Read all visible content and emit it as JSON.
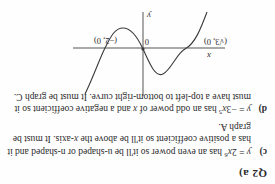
{
  "page": {
    "question_marker": "Q2 a)"
  },
  "graph": {
    "x_axis_label": "x",
    "y_axis_label": "y",
    "origin_label": "0",
    "labels": {
      "left_root": "(√3, 0)",
      "right_root": "(−2, 0)"
    }
  },
  "chart_data": {
    "type": "line",
    "title": "",
    "xlabel": "x",
    "ylabel": "y",
    "grid": false,
    "legend": null,
    "xlim": [
      -3.6,
      3.2
    ],
    "ylim": [
      -2.6,
      3.2
    ],
    "annotations": [
      {
        "text": "(√3, 0)",
        "x": -1.73,
        "y": 0
      },
      {
        "text": "(−2, 0)",
        "x": 2.0,
        "y": 0
      },
      {
        "text": "0",
        "x": 0.18,
        "y": 0
      }
    ],
    "series": [
      {
        "name": "cubic",
        "description": "cubic curve rising from lower left, local maximum left of the y-axis, passing through the origin, local minimum right of the y-axis, then rising steeply",
        "x": [
          -2.6,
          -2.3,
          -2.0,
          -1.73,
          -1.5,
          -1.2,
          -1.0,
          -0.8,
          -0.5,
          -0.2,
          0.0,
          0.3,
          0.6,
          0.9,
          1.2,
          1.5,
          1.8,
          2.0,
          2.3,
          2.6,
          2.9
        ],
        "y": [
          -3.1,
          -1.55,
          -0.6,
          0.0,
          0.45,
          0.95,
          1.15,
          1.22,
          1.0,
          0.45,
          0.0,
          -0.65,
          -1.15,
          -1.45,
          -1.5,
          -1.25,
          -0.6,
          0.0,
          1.15,
          2.7,
          4.6
        ]
      }
    ]
  },
  "answers": [
    {
      "marker": "c)",
      "html": "<i>y</i> = 2<i>x</i><sup>6</sup> has an even power so it'll be u-shaped or n-shaped and it has a positive coefficient so it'll be above the <i>x</i>-axis.  It must be graph A.",
      "plain": "y = 2x^6 has an even power so it'll be u-shaped or n-shaped and it has a positive coefficient so it'll be above the x-axis. It must be graph A."
    },
    {
      "marker": "d)",
      "html": "<i>y</i> = −3<i>x</i><sup>5</sup> has an odd power of <i>x</i> and a negative coefficient so it must have a top-left to bottom-right curve.  It must be graph C.",
      "plain": "y = -3x^5 has an odd power of x and a negative coefficient so it must have a top-left to bottom-right curve. It must be graph C."
    }
  ]
}
